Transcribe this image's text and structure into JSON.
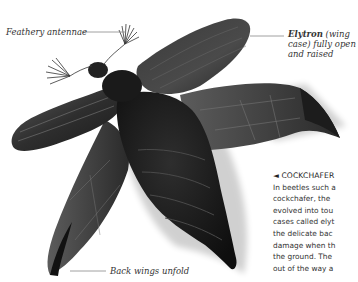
{
  "labels": {
    "antennae": "Feathery antennae",
    "elytron_bold": "Elytron",
    "elytron_rest_1": " (wing",
    "elytron_line2": "case) fully open",
    "elytron_line3": "and raised",
    "back_wings": "Back wings unfold"
  },
  "caption": {
    "arrow": "◄",
    "title": "COCKCHAFER",
    "lines": [
      "In beetles such a",
      "cockchafer, the",
      "evolved into tou",
      "cases called elyt",
      "the delicate bac",
      "damage when th",
      "the ground. The",
      "out of the way a"
    ]
  },
  "image": {
    "subject": "cockchafer beetle in flight"
  }
}
